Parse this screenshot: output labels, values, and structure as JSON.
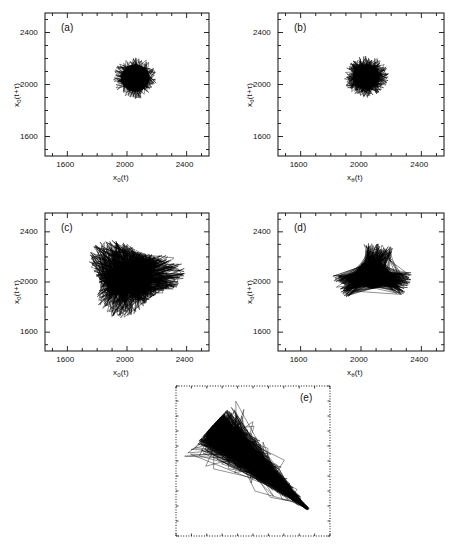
{
  "figure": {
    "type": "phase-space-delay-embedding-grid",
    "background": "#ffffff",
    "ink": "#000000",
    "panel_count": 5
  },
  "chart_data": [
    {
      "id": "a",
      "type": "scatter",
      "tag": "(a)",
      "title": "",
      "xlabel": "x_0(t)",
      "ylabel": "x_0(t+τ)",
      "xlabel_parts": {
        "base": "x",
        "sub": "0",
        "arg": "(t)"
      },
      "ylabel_parts": {
        "base": "x",
        "sub": "0",
        "arg": "(t+τ)"
      },
      "xlim": [
        1450,
        2550
      ],
      "ylim": [
        1450,
        2550
      ],
      "xticks": [
        1600,
        2000,
        2400
      ],
      "yticks": [
        1600,
        2000,
        2400
      ],
      "xticklabels": [
        "1600",
        "2000",
        "2400"
      ],
      "yticklabels": [
        "1600",
        "2000",
        "2400"
      ],
      "minor_ticks_per_interval": 4,
      "grid": false,
      "legend": false,
      "frame": "solid",
      "trace": {
        "style": "continuous-line",
        "center": [
          2055,
          2050
        ],
        "radius_x": 95,
        "radius_y": 105,
        "density": "very-dense-core",
        "outliers": 0.06,
        "outlier_scale": 1.55,
        "points": 2600,
        "seed": 11,
        "shape": "round-compact"
      }
    },
    {
      "id": "b",
      "type": "scatter",
      "tag": "(b)",
      "title": "",
      "xlabel": "x_θ(t)",
      "ylabel": "x_θ(t+τ)",
      "xlabel_parts": {
        "base": "x",
        "sub": "θ",
        "arg": "(t)"
      },
      "ylabel_parts": {
        "base": "x",
        "sub": "θ",
        "arg": "(t+τ)"
      },
      "xlim": [
        1450,
        2550
      ],
      "ylim": [
        1450,
        2550
      ],
      "xticks": [
        1600,
        2000,
        2400
      ],
      "yticks": [
        1600,
        2000,
        2400
      ],
      "xticklabels": [
        "1600",
        "2000",
        "2400"
      ],
      "yticklabels": [
        "1600",
        "2000",
        "2400"
      ],
      "minor_ticks_per_interval": 4,
      "grid": false,
      "legend": false,
      "frame": "solid",
      "trace": {
        "style": "continuous-line",
        "center": [
          2035,
          2060
        ],
        "radius_x": 88,
        "radius_y": 95,
        "density": "dense-core-spiky",
        "outliers": 0.1,
        "outlier_scale": 1.7,
        "points": 2600,
        "seed": 23,
        "shape": "star-spiky"
      }
    },
    {
      "id": "c",
      "type": "scatter",
      "tag": "(c)",
      "title": "",
      "xlabel": "x_0(t)",
      "ylabel": "x_0(t+τ)",
      "xlabel_parts": {
        "base": "x",
        "sub": "0",
        "arg": "(t)"
      },
      "ylabel_parts": {
        "base": "x",
        "sub": "0",
        "arg": "(t+τ)"
      },
      "xlim": [
        1450,
        2550
      ],
      "ylim": [
        1450,
        2550
      ],
      "xticks": [
        1600,
        2000,
        2400
      ],
      "yticks": [
        1600,
        2000,
        2400
      ],
      "xticklabels": [
        "1600",
        "2000",
        "2400"
      ],
      "yticklabels": [
        "1600",
        "2000",
        "2400"
      ],
      "minor_ticks_per_interval": 4,
      "grid": false,
      "legend": false,
      "frame": "solid",
      "trace": {
        "style": "continuous-line",
        "center": [
          2030,
          2040
        ],
        "radius_x": 230,
        "radius_y": 210,
        "density": "broad-diffuse",
        "outliers": 0.3,
        "outlier_scale": 1.5,
        "points": 2400,
        "seed": 37,
        "shape": "broad-irregular"
      }
    },
    {
      "id": "d",
      "type": "scatter",
      "tag": "(d)",
      "title": "",
      "xlabel": "x_θ(t)",
      "ylabel": "x_θ(t+τ)",
      "xlabel_parts": {
        "base": "x",
        "sub": "θ",
        "arg": "(t)"
      },
      "ylabel_parts": {
        "base": "x",
        "sub": "θ",
        "arg": "(t+τ)"
      },
      "xlim": [
        1450,
        2550
      ],
      "ylim": [
        1450,
        2550
      ],
      "xticks": [
        1600,
        2000,
        2400
      ],
      "yticks": [
        1600,
        2000,
        2400
      ],
      "xticklabels": [
        "1600",
        "2000",
        "2400"
      ],
      "yticklabels": [
        "1600",
        "2000",
        "2400"
      ],
      "minor_ticks_per_interval": 4,
      "grid": false,
      "legend": false,
      "frame": "solid",
      "trace": {
        "style": "continuous-line",
        "center": [
          2075,
          2060
        ],
        "radius_x": 110,
        "radius_y": 110,
        "density": "dense-core-three-lobes",
        "outliers": 0.16,
        "outlier_scale": 2.4,
        "points": 2600,
        "seed": 53,
        "shape": "three-lobed",
        "lobe_angles_deg": [
          78,
          205,
          340
        ]
      }
    },
    {
      "id": "e",
      "type": "scatter",
      "tag": "(e)",
      "title": "",
      "xlabel": "",
      "ylabel": "",
      "xlim": [
        1450,
        2550
      ],
      "ylim": [
        1450,
        2550
      ],
      "xticks": [],
      "yticks": [],
      "xticklabels": [],
      "yticklabels": [],
      "minor_ticks_per_interval": 0,
      "grid": false,
      "legend": false,
      "frame": "dotted",
      "trace": {
        "style": "continuous-line",
        "center": [
          2000,
          2000
        ],
        "correlation": -0.97,
        "major_axis_deg": -42,
        "major_halflength": 460,
        "minor_halflength": 62,
        "taper": true,
        "density": "dense-upper-left",
        "points": 3000,
        "seed": 71,
        "shape": "elongated-antidiagonal"
      }
    }
  ],
  "panels": {
    "a": {
      "tag": "(a)"
    },
    "b": {
      "tag": "(b)"
    },
    "c": {
      "tag": "(c)"
    },
    "d": {
      "tag": "(d)"
    },
    "e": {
      "tag": "(e)"
    }
  }
}
